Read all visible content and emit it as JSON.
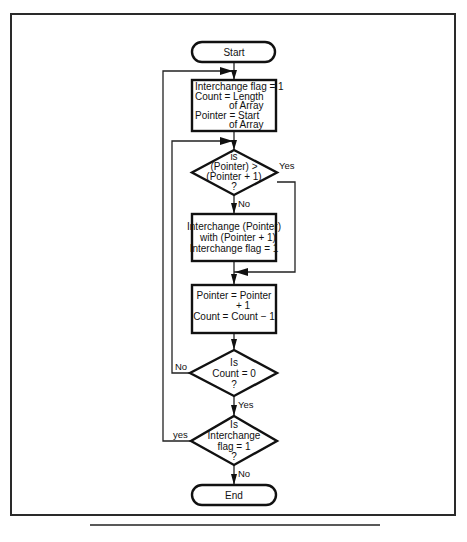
{
  "diagram": {
    "type": "flowchart",
    "nodes": {
      "start": {
        "kind": "terminal",
        "lines": [
          "Start"
        ]
      },
      "init": {
        "kind": "process",
        "lines": [
          "Interchange flag = 1",
          "Count = Length",
          "of Array",
          "Pointer = Start",
          "of Array"
        ]
      },
      "compare": {
        "kind": "decision",
        "lines": [
          "is",
          "(Pointer) >",
          "(Pointer + 1)",
          "?"
        ]
      },
      "swap": {
        "kind": "process",
        "lines": [
          "Interchange (Pointer)",
          "with (Pointer + 1)",
          "Interchange flag = 1"
        ]
      },
      "advance": {
        "kind": "process",
        "lines": [
          "Pointer = Pointer",
          "+ 1",
          "Count = Count − 1"
        ]
      },
      "count_zero": {
        "kind": "decision",
        "lines": [
          "Is",
          "Count = 0",
          "?"
        ]
      },
      "flag_check": {
        "kind": "decision",
        "lines": [
          "Is",
          "Interchange",
          "flag = 1",
          "?"
        ]
      },
      "end": {
        "kind": "terminal",
        "lines": [
          "End"
        ]
      }
    },
    "edge_labels": {
      "compare_yes": "Yes",
      "compare_no": "No",
      "count_zero_no": "No",
      "count_zero_yes": "Yes",
      "flag_check_yes": "yes",
      "flag_check_no": "No"
    },
    "edges": [
      {
        "from": "start",
        "to": "init",
        "label": ""
      },
      {
        "from": "init",
        "to": "compare",
        "label": ""
      },
      {
        "from": "compare",
        "to": "swap",
        "label": "No"
      },
      {
        "from": "compare",
        "to": "advance",
        "label": "Yes"
      },
      {
        "from": "swap",
        "to": "advance",
        "label": ""
      },
      {
        "from": "advance",
        "to": "count_zero",
        "label": ""
      },
      {
        "from": "count_zero",
        "to": "compare",
        "label": "No"
      },
      {
        "from": "count_zero",
        "to": "flag_check",
        "label": "Yes"
      },
      {
        "from": "flag_check",
        "to": "init",
        "label": "yes"
      },
      {
        "from": "flag_check",
        "to": "end",
        "label": "No"
      }
    ]
  }
}
